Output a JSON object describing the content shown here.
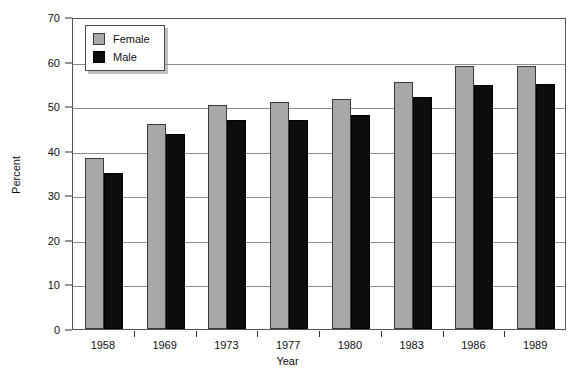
{
  "chart_data": {
    "type": "bar",
    "title": "",
    "xlabel": "Year",
    "ylabel": "Percent",
    "categories": [
      "1958",
      "1969",
      "1973",
      "1977",
      "1980",
      "1983",
      "1986",
      "1989"
    ],
    "series": [
      {
        "name": "Female",
        "color": "#a8a8a8",
        "values": [
          38.3,
          46.0,
          50.3,
          51.0,
          51.6,
          55.5,
          59.1,
          59.1
        ]
      },
      {
        "name": "Male",
        "color": "#0d0d0d",
        "values": [
          35.0,
          43.7,
          47.0,
          47.0,
          48.0,
          52.0,
          54.7,
          55.0
        ]
      }
    ],
    "ylim": [
      0,
      70
    ],
    "yticks": [
      0,
      10,
      20,
      30,
      40,
      50,
      60,
      70
    ],
    "ytick_labels": [
      "0",
      "10",
      "20",
      "30",
      "40",
      "50",
      "60",
      "70"
    ],
    "grid": true,
    "legend_position": "top-left"
  },
  "legend": {
    "entries": [
      {
        "label": "Female",
        "swatch": "female-swatch"
      },
      {
        "label": "Male",
        "swatch": "male-swatch"
      }
    ]
  }
}
